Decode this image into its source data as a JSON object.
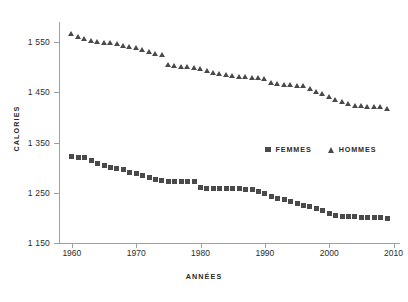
{
  "chart_data": {
    "type": "scatter",
    "title": "",
    "xlabel": "ANNÉES",
    "ylabel": "CALORIES",
    "xlim": [
      1958,
      2011
    ],
    "ylim": [
      1150,
      1590
    ],
    "grid": false,
    "legend_position": "inside-right",
    "marker_color": "#4a4a4a",
    "axis_color": "#9aa0a6",
    "xticks": [
      1960,
      1970,
      1980,
      1990,
      2000,
      2010
    ],
    "xtick_labels": [
      "1960",
      "1970",
      "1980",
      "1990",
      "2000",
      "2010"
    ],
    "yticks": [
      1150,
      1250,
      1350,
      1450,
      1550
    ],
    "ytick_labels": [
      "1 150",
      "1 250",
      "1 350",
      "1 450",
      "1 550"
    ],
    "x": [
      1960,
      1961,
      1962,
      1963,
      1964,
      1965,
      1966,
      1967,
      1968,
      1969,
      1970,
      1971,
      1972,
      1973,
      1974,
      1975,
      1976,
      1977,
      1978,
      1979,
      1980,
      1981,
      1982,
      1983,
      1984,
      1985,
      1986,
      1987,
      1988,
      1989,
      1990,
      1991,
      1992,
      1993,
      1994,
      1995,
      1996,
      1997,
      1998,
      1999,
      2000,
      2001,
      2002,
      2003,
      2004,
      2005,
      2006,
      2007,
      2008,
      2009
    ],
    "series": [
      {
        "name": "HOMMES",
        "marker": "triangle",
        "color": "#4a4a4a",
        "values": [
          1566,
          1560,
          1556,
          1553,
          1551,
          1549,
          1548,
          1546,
          1543,
          1540,
          1538,
          1534,
          1530,
          1527,
          1525,
          1505,
          1503,
          1501,
          1500,
          1498,
          1496,
          1492,
          1488,
          1486,
          1484,
          1482,
          1481,
          1480,
          1479,
          1478,
          1477,
          1468,
          1466,
          1465,
          1464,
          1463,
          1462,
          1458,
          1452,
          1447,
          1442,
          1436,
          1431,
          1427,
          1424,
          1423,
          1422,
          1422,
          1421,
          1418
        ]
      },
      {
        "name": "FEMMES",
        "marker": "square",
        "color": "#4a4a4a",
        "values": [
          1322,
          1321,
          1320,
          1314,
          1309,
          1305,
          1301,
          1298,
          1296,
          1291,
          1288,
          1284,
          1281,
          1277,
          1274,
          1273,
          1273,
          1272,
          1272,
          1272,
          1260,
          1259,
          1259,
          1258,
          1258,
          1258,
          1258,
          1257,
          1257,
          1252,
          1248,
          1243,
          1239,
          1236,
          1232,
          1228,
          1225,
          1222,
          1218,
          1214,
          1209,
          1205,
          1203,
          1202,
          1202,
          1201,
          1201,
          1201,
          1200,
          1199
        ]
      }
    ]
  },
  "legend": {
    "items": [
      {
        "label": "FEMMES",
        "marker": "square"
      },
      {
        "label": "HOMMES",
        "marker": "triangle"
      }
    ]
  }
}
